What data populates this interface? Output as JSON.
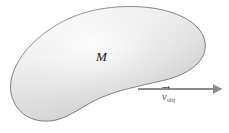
{
  "figure": {
    "background_color": "#ffffff",
    "width": 229,
    "height": 133
  },
  "shape": {
    "name": "irregular-blob",
    "label": "M",
    "fill_light": "#f2f2f2",
    "fill_mid": "#dddddd",
    "fill_dark": "#c9c9c9",
    "stroke_color": "#6e6e6e",
    "stroke_width": 0.9
  },
  "vector": {
    "symbol": "v",
    "subscript": "obj",
    "arrow_color": "#8c8c8c",
    "label_color": "#4a4a4a",
    "direction": "right",
    "start_x": 138,
    "end_x": 222,
    "y": 89
  }
}
